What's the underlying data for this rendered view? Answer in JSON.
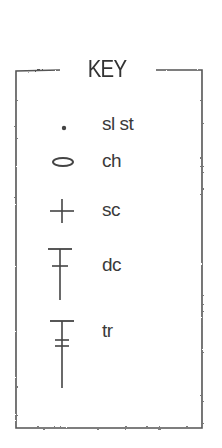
{
  "key": {
    "title": "KEY",
    "items": [
      {
        "symbol": "dot-icon",
        "label": "sl st"
      },
      {
        "symbol": "oval-icon",
        "label": "ch"
      },
      {
        "symbol": "plus-icon",
        "label": "sc"
      },
      {
        "symbol": "dc-stitch-icon",
        "label": "dc"
      },
      {
        "symbol": "tr-stitch-icon",
        "label": "tr"
      }
    ]
  },
  "colors": {
    "ink": "#3a3a3a",
    "background": "#ffffff"
  }
}
